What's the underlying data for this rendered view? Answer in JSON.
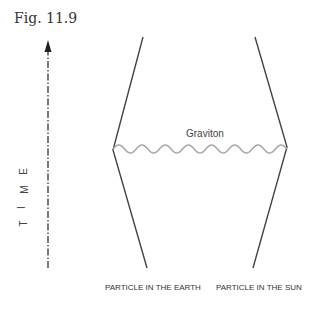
{
  "figure": {
    "title": "Fig. 11.9",
    "axis_label": [
      "T",
      "I",
      "M",
      "E"
    ],
    "graviton_label": "Graviton",
    "left_particle_label": "PARTICLE IN THE EARTH",
    "right_particle_label": "PARTICLE IN THE SUN"
  }
}
